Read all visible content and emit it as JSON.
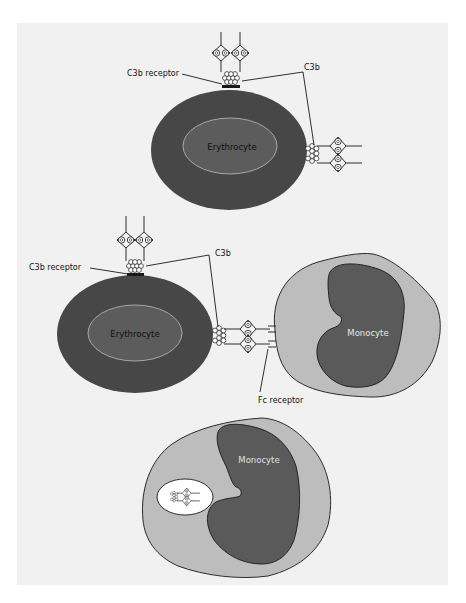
{
  "figure": {
    "background": "#ffffff",
    "panel_color": "#f1f1f1",
    "colors": {
      "erythrocyte_outer": "#474747",
      "erythrocyte_inner": "#5c5c5c",
      "erythrocyte_inner_stroke": "#bdbdbd",
      "monocyte_cytoplasm": "#bdbdbd",
      "monocyte_nucleus": "#5a5a5a",
      "phagosome": "#ffffff",
      "line": "#1a1a1a"
    }
  },
  "panel1": {
    "cell_label": "Erythrocyte",
    "receptor_label": "C3b receptor",
    "c3b_label": "C3b"
  },
  "panel2": {
    "cell_label": "Erythrocyte",
    "receptor_label": "C3b receptor",
    "c3b_label": "C3b",
    "monocyte_label": "Monocyte",
    "fc_receptor_label": "Fc receptor"
  },
  "panel3": {
    "monocyte_label": "Monocyte"
  }
}
